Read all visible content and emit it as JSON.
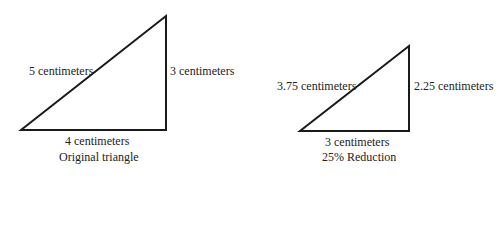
{
  "original": {
    "hypotenuse_label": "5 centimeters",
    "vertical_label": "3 centimeters",
    "base_label": "4 centimeters",
    "caption": "Original triangle"
  },
  "reduced": {
    "hypotenuse_label": "3.75 centimeters",
    "vertical_label": "2.25 centimeters",
    "base_label": "3 centimeters",
    "caption": "25% Reduction"
  },
  "colors": {
    "stroke": "#1a1a1a",
    "text": "#222222",
    "background": "#ffffff"
  }
}
